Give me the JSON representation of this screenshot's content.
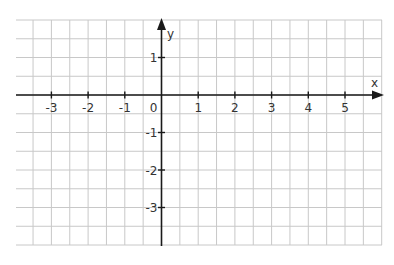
{
  "chart_data": {
    "type": "coordinate-grid",
    "title": "",
    "xlabel": "x",
    "ylabel": "y",
    "xlim": [
      -4,
      6
    ],
    "ylim": [
      -4,
      2
    ],
    "grid": true,
    "grid_step": 0.5,
    "x_tick_labels": [
      "-3",
      "-2",
      "-1",
      "0",
      "1",
      "2",
      "3",
      "4",
      "5"
    ],
    "y_tick_labels": [
      "1",
      "-1",
      "-2",
      "-3"
    ],
    "series": []
  },
  "colors": {
    "grid": "#c8c8c8",
    "axis": "#1a1a1a",
    "label": "#333333",
    "background": "#ffffff"
  }
}
